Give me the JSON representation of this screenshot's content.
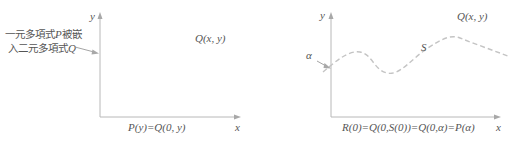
{
  "left_panel": {
    "annotation_line1_prefix": "一元多項式",
    "annotation_line1_var": "P",
    "annotation_line1_suffix": "被嵌",
    "annotation_line2_prefix": "入二元多項式",
    "annotation_line2_var": "Q",
    "y_axis_label": "y",
    "x_axis_label": "x",
    "function_label": "Q(x, y)",
    "bottom_equation": "P(y)=Q(0, y)"
  },
  "right_panel": {
    "y_axis_label": "y",
    "x_axis_label": "x",
    "function_label": "Q(x, y)",
    "curve_label": "S",
    "point_label": "α",
    "bottom_equation": "R(0)=Q(0,S(0))=Q(0,α)=P(α)"
  },
  "colors": {
    "axis": "#b8b8b8",
    "curve": "#c4c4c4",
    "text": "#555555"
  }
}
